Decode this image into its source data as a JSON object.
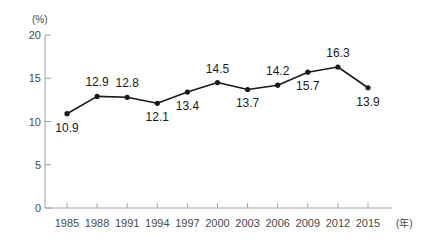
{
  "chart_data": {
    "type": "line",
    "title": "",
    "xlabel": "(年)",
    "ylabel": "(%)",
    "categories": [
      "1985",
      "1988",
      "1991",
      "1994",
      "1997",
      "2000",
      "2003",
      "2006",
      "2009",
      "2012",
      "2015"
    ],
    "values": [
      10.9,
      12.9,
      12.8,
      12.1,
      13.4,
      14.5,
      13.7,
      14.2,
      15.7,
      16.3,
      13.9
    ],
    "point_labels": [
      "10.9",
      "12.9",
      "12.8",
      "12.1",
      "13.4",
      "14.5",
      "13.7",
      "14.2",
      "15.7",
      "16.3",
      "13.9"
    ],
    "label_positions": [
      "below",
      "above",
      "above",
      "below",
      "below",
      "above",
      "below",
      "above",
      "below",
      "above",
      "below"
    ],
    "ylim": [
      0,
      20
    ],
    "yticks": [
      0,
      5,
      10,
      15,
      20
    ],
    "ytick_labels": [
      "0",
      "5",
      "10",
      "15",
      "20"
    ],
    "grid": false,
    "legend": "none",
    "series_color": "#1a1a1a",
    "axis_color": "#a0a0a0",
    "label_color": "#1a1a1a",
    "tick_label_color": "#4a4a4a",
    "background_color": "#ffffff"
  }
}
